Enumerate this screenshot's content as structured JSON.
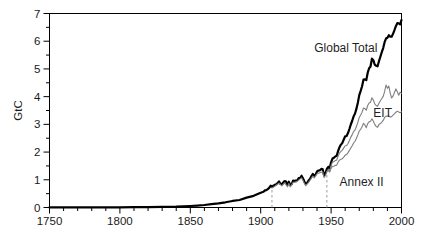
{
  "figure": {
    "background": "#ffffff",
    "axis_color": "#000000",
    "tick_label_color": "#1a1a1a",
    "series_label_color": "#1f1f1f",
    "thin_line_color": "#7f7f7f",
    "dashed_line_color": "#9a9a9a"
  },
  "chart_data": {
    "type": "line",
    "title": "",
    "xlabel": "",
    "ylabel": "GtC",
    "xlim": [
      1750,
      2000
    ],
    "ylim": [
      0,
      7
    ],
    "grid": false,
    "legend": "inline-labels",
    "x_major_ticks": [
      1750,
      1800,
      1850,
      1900,
      1950,
      2000
    ],
    "x_tick_labels": [
      "1750",
      "1800",
      "1850",
      "1900",
      "1950",
      "2000"
    ],
    "x_minor_step": 10,
    "y_major_ticks": [
      0,
      1,
      2,
      3,
      4,
      5,
      6,
      7
    ],
    "y_tick_labels": [
      "0",
      "1",
      "2",
      "3",
      "4",
      "5",
      "6",
      "7"
    ],
    "y_minor_step": 0.5,
    "annotations": {
      "dashed_vertical_lines": [
        {
          "x": 1908,
          "y_from": 0,
          "y_to": 0.78
        },
        {
          "x": 1947,
          "y_from": 0,
          "y_to": 1.4
        }
      ],
      "series_labels": [
        {
          "text": "Global Total",
          "x": 1938,
          "y": 5.62,
          "anchor": "start",
          "size": 12
        },
        {
          "text": "EIT",
          "x": 1980,
          "y": 3.28,
          "anchor": "start",
          "size": 12
        },
        {
          "text": "Annex II",
          "x": 1956,
          "y": 0.78,
          "anchor": "start",
          "size": 12
        }
      ]
    },
    "series": [
      {
        "name": "Global Total",
        "color": "#000000",
        "width": 2.2,
        "points": [
          [
            1750,
            0.003
          ],
          [
            1760,
            0.003
          ],
          [
            1770,
            0.003
          ],
          [
            1780,
            0.004
          ],
          [
            1790,
            0.005
          ],
          [
            1800,
            0.008
          ],
          [
            1810,
            0.01
          ],
          [
            1820,
            0.014
          ],
          [
            1830,
            0.024
          ],
          [
            1840,
            0.033
          ],
          [
            1850,
            0.054
          ],
          [
            1855,
            0.07
          ],
          [
            1860,
            0.091
          ],
          [
            1865,
            0.12
          ],
          [
            1870,
            0.147
          ],
          [
            1875,
            0.188
          ],
          [
            1880,
            0.236
          ],
          [
            1885,
            0.27
          ],
          [
            1890,
            0.356
          ],
          [
            1895,
            0.42
          ],
          [
            1900,
            0.534
          ],
          [
            1901,
            0.552
          ],
          [
            1902,
            0.566
          ],
          [
            1903,
            0.617
          ],
          [
            1904,
            0.624
          ],
          [
            1905,
            0.663
          ],
          [
            1906,
            0.707
          ],
          [
            1907,
            0.784
          ],
          [
            1908,
            0.75
          ],
          [
            1909,
            0.785
          ],
          [
            1910,
            0.819
          ],
          [
            1911,
            0.836
          ],
          [
            1912,
            0.879
          ],
          [
            1913,
            0.943
          ],
          [
            1914,
            0.85
          ],
          [
            1915,
            0.838
          ],
          [
            1916,
            0.901
          ],
          [
            1917,
            0.955
          ],
          [
            1918,
            0.936
          ],
          [
            1919,
            0.806
          ],
          [
            1920,
            0.932
          ],
          [
            1921,
            0.803
          ],
          [
            1922,
            0.845
          ],
          [
            1923,
            0.97
          ],
          [
            1924,
            0.963
          ],
          [
            1925,
            0.975
          ],
          [
            1926,
            0.983
          ],
          [
            1927,
            1.062
          ],
          [
            1928,
            1.065
          ],
          [
            1929,
            1.145
          ],
          [
            1930,
            1.053
          ],
          [
            1931,
            0.94
          ],
          [
            1932,
            0.847
          ],
          [
            1933,
            0.893
          ],
          [
            1934,
            0.973
          ],
          [
            1935,
            1.027
          ],
          [
            1936,
            1.13
          ],
          [
            1937,
            1.209
          ],
          [
            1938,
            1.142
          ],
          [
            1939,
            1.192
          ],
          [
            1940,
            1.299
          ],
          [
            1941,
            1.334
          ],
          [
            1942,
            1.342
          ],
          [
            1943,
            1.391
          ],
          [
            1944,
            1.383
          ],
          [
            1945,
            1.16
          ],
          [
            1946,
            1.238
          ],
          [
            1947,
            1.392
          ],
          [
            1948,
            1.469
          ],
          [
            1949,
            1.419
          ],
          [
            1950,
            1.63
          ],
          [
            1951,
            1.767
          ],
          [
            1952,
            1.795
          ],
          [
            1953,
            1.841
          ],
          [
            1954,
            1.865
          ],
          [
            1955,
            2.043
          ],
          [
            1956,
            2.178
          ],
          [
            1957,
            2.27
          ],
          [
            1958,
            2.33
          ],
          [
            1959,
            2.454
          ],
          [
            1960,
            2.569
          ],
          [
            1961,
            2.58
          ],
          [
            1962,
            2.686
          ],
          [
            1963,
            2.833
          ],
          [
            1964,
            2.995
          ],
          [
            1965,
            3.13
          ],
          [
            1966,
            3.288
          ],
          [
            1967,
            3.393
          ],
          [
            1968,
            3.566
          ],
          [
            1969,
            3.78
          ],
          [
            1970,
            4.053
          ],
          [
            1971,
            4.208
          ],
          [
            1972,
            4.376
          ],
          [
            1973,
            4.614
          ],
          [
            1974,
            4.623
          ],
          [
            1975,
            4.596
          ],
          [
            1976,
            4.864
          ],
          [
            1977,
            5.026
          ],
          [
            1978,
            5.087
          ],
          [
            1979,
            5.369
          ],
          [
            1980,
            5.315
          ],
          [
            1981,
            5.152
          ],
          [
            1982,
            5.113
          ],
          [
            1983,
            5.094
          ],
          [
            1984,
            5.28
          ],
          [
            1985,
            5.439
          ],
          [
            1986,
            5.607
          ],
          [
            1987,
            5.752
          ],
          [
            1988,
            5.965
          ],
          [
            1989,
            6.096
          ],
          [
            1990,
            6.127
          ],
          [
            1991,
            6.217
          ],
          [
            1992,
            6.164
          ],
          [
            1993,
            6.162
          ],
          [
            1994,
            6.266
          ],
          [
            1995,
            6.398
          ],
          [
            1996,
            6.542
          ],
          [
            1997,
            6.651
          ],
          [
            1998,
            6.643
          ],
          [
            1999,
            6.61
          ],
          [
            2000,
            6.766
          ]
        ]
      },
      {
        "name": "EIT",
        "color": "#7f7f7f",
        "width": 1.1,
        "points": [
          [
            1908,
            0.7
          ],
          [
            1910,
            0.765
          ],
          [
            1913,
            0.88
          ],
          [
            1915,
            0.78
          ],
          [
            1917,
            0.89
          ],
          [
            1919,
            0.75
          ],
          [
            1920,
            0.87
          ],
          [
            1921,
            0.745
          ],
          [
            1923,
            0.905
          ],
          [
            1925,
            0.91
          ],
          [
            1927,
            0.99
          ],
          [
            1929,
            1.07
          ],
          [
            1930,
            0.98
          ],
          [
            1931,
            0.875
          ],
          [
            1932,
            0.79
          ],
          [
            1934,
            0.905
          ],
          [
            1936,
            1.055
          ],
          [
            1937,
            1.13
          ],
          [
            1938,
            1.065
          ],
          [
            1940,
            1.215
          ],
          [
            1942,
            1.255
          ],
          [
            1944,
            1.292
          ],
          [
            1945,
            1.08
          ],
          [
            1946,
            1.155
          ],
          [
            1947,
            1.3
          ],
          [
            1948,
            1.37
          ],
          [
            1949,
            1.325
          ],
          [
            1950,
            1.52
          ],
          [
            1951,
            1.64
          ],
          [
            1952,
            1.655
          ],
          [
            1953,
            1.695
          ],
          [
            1954,
            1.71
          ],
          [
            1955,
            1.86
          ],
          [
            1956,
            1.965
          ],
          [
            1957,
            2.03
          ],
          [
            1958,
            2.07
          ],
          [
            1959,
            2.15
          ],
          [
            1960,
            2.23
          ],
          [
            1961,
            2.235
          ],
          [
            1962,
            2.31
          ],
          [
            1963,
            2.42
          ],
          [
            1964,
            2.54
          ],
          [
            1965,
            2.63
          ],
          [
            1966,
            2.74
          ],
          [
            1967,
            2.8
          ],
          [
            1968,
            2.92
          ],
          [
            1969,
            3.07
          ],
          [
            1970,
            3.25
          ],
          [
            1971,
            3.34
          ],
          [
            1972,
            3.44
          ],
          [
            1973,
            3.59
          ],
          [
            1974,
            3.57
          ],
          [
            1975,
            3.51
          ],
          [
            1976,
            3.68
          ],
          [
            1977,
            3.77
          ],
          [
            1978,
            3.8
          ],
          [
            1979,
            3.96
          ],
          [
            1980,
            3.88
          ],
          [
            1981,
            3.74
          ],
          [
            1982,
            3.68
          ],
          [
            1983,
            3.65
          ],
          [
            1984,
            3.76
          ],
          [
            1985,
            3.85
          ],
          [
            1986,
            3.93
          ],
          [
            1987,
            4.01
          ],
          [
            1988,
            4.18
          ],
          [
            1989,
            4.42
          ],
          [
            1990,
            4.3
          ],
          [
            1991,
            4.38
          ],
          [
            1992,
            4.12
          ],
          [
            1993,
            3.95
          ],
          [
            1994,
            4.02
          ],
          [
            1995,
            4.15
          ],
          [
            1996,
            4.28
          ],
          [
            1997,
            4.18
          ],
          [
            1998,
            4.05
          ],
          [
            1999,
            4.16
          ],
          [
            2000,
            4.12
          ]
        ]
      },
      {
        "name": "Annex II",
        "color": "#7f7f7f",
        "width": 1.1,
        "points": [
          [
            1947,
            1.31
          ],
          [
            1948,
            1.33
          ],
          [
            1949,
            1.28
          ],
          [
            1950,
            1.41
          ],
          [
            1951,
            1.49
          ],
          [
            1952,
            1.49
          ],
          [
            1953,
            1.52
          ],
          [
            1954,
            1.53
          ],
          [
            1955,
            1.64
          ],
          [
            1956,
            1.71
          ],
          [
            1957,
            1.74
          ],
          [
            1958,
            1.76
          ],
          [
            1959,
            1.82
          ],
          [
            1960,
            1.89
          ],
          [
            1961,
            1.91
          ],
          [
            1962,
            1.98
          ],
          [
            1963,
            2.06
          ],
          [
            1964,
            2.15
          ],
          [
            1965,
            2.23
          ],
          [
            1966,
            2.33
          ],
          [
            1967,
            2.39
          ],
          [
            1968,
            2.5
          ],
          [
            1969,
            2.62
          ],
          [
            1970,
            2.76
          ],
          [
            1971,
            2.82
          ],
          [
            1972,
            2.91
          ],
          [
            1973,
            3.04
          ],
          [
            1974,
            2.98
          ],
          [
            1975,
            2.88
          ],
          [
            1976,
            3.03
          ],
          [
            1977,
            3.09
          ],
          [
            1978,
            3.11
          ],
          [
            1979,
            3.2
          ],
          [
            1980,
            3.11
          ],
          [
            1981,
            3.0
          ],
          [
            1982,
            2.92
          ],
          [
            1983,
            2.9
          ],
          [
            1984,
            2.99
          ],
          [
            1985,
            3.03
          ],
          [
            1986,
            3.08
          ],
          [
            1987,
            3.14
          ],
          [
            1988,
            3.25
          ],
          [
            1989,
            3.3
          ],
          [
            1990,
            3.29
          ],
          [
            1991,
            3.31
          ],
          [
            1992,
            3.26
          ],
          [
            1993,
            3.28
          ],
          [
            1994,
            3.33
          ],
          [
            1995,
            3.38
          ],
          [
            1996,
            3.44
          ],
          [
            1997,
            3.47
          ],
          [
            1998,
            3.45
          ],
          [
            1999,
            3.42
          ],
          [
            2000,
            3.45
          ]
        ]
      }
    ]
  }
}
